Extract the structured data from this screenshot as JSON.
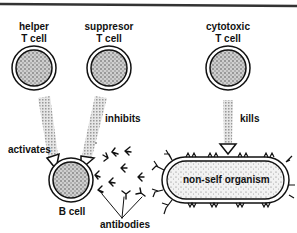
{
  "diagram": {
    "title": "",
    "cells": {
      "helper": {
        "line1": "helper",
        "line2": "T cell"
      },
      "suppressor": {
        "line1": "suppresor",
        "line2": "T cell"
      },
      "cytotoxic": {
        "line1": "cytotoxic",
        "line2": "T cell"
      },
      "b_cell": {
        "label": "B cell"
      }
    },
    "relations": {
      "activates": "activates",
      "inhibits": "inhibits",
      "kills": "kills"
    },
    "antibodies_label": "antibodies",
    "organism_label": "non-self organism",
    "colors": {
      "ink": "#111111",
      "stipple": "#8a8a8a",
      "arrow_hatch": "#b0b0b0",
      "border": "#333333"
    }
  }
}
